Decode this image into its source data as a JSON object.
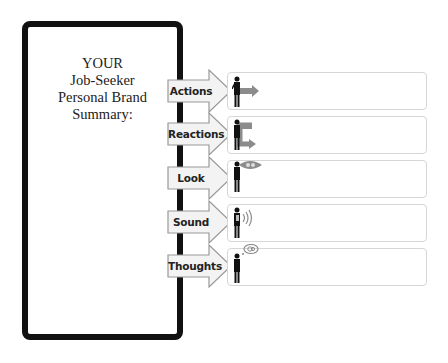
{
  "summary_panel": {
    "title_lines": [
      "YOUR",
      "Job-Seeker",
      "Personal Brand",
      "Summary:"
    ]
  },
  "rows": [
    {
      "label": "Actions",
      "icon": "person-pointing-arrow-icon",
      "value": ""
    },
    {
      "label": "Reactions",
      "icon": "person-return-arrow-icon",
      "value": ""
    },
    {
      "label": "Look",
      "icon": "person-eye-icon",
      "value": ""
    },
    {
      "label": "Sound",
      "icon": "person-sound-waves-icon",
      "value": ""
    },
    {
      "label": "Thoughts",
      "icon": "person-thought-bubble-icon",
      "value": ""
    }
  ],
  "colors": {
    "panel_border": "#111111",
    "arrow_fill": "#f3f3f3",
    "arrow_stroke": "#9a9a9a",
    "icon_gray": "#8c8c8c",
    "box_border": "#d6d6d6"
  }
}
